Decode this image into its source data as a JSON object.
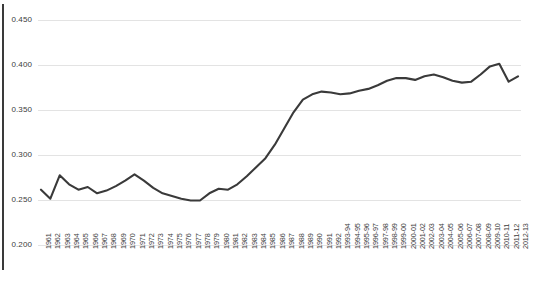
{
  "chart_data": {
    "type": "line",
    "title": "",
    "subtitle": "",
    "xlabel": "",
    "ylabel": "",
    "ylim": [
      0.2,
      0.45
    ],
    "ytick_values": [
      0.2,
      0.25,
      0.3,
      0.35,
      0.4,
      0.45
    ],
    "ytick_labels": [
      "0.200",
      "0.250",
      "0.300",
      "0.350",
      "0.400",
      "0.450"
    ],
    "grid": true,
    "legend": "none",
    "line_color": "#3a3a3a",
    "grid_color": "#e3e3e3",
    "categories": [
      "1961",
      "1962",
      "1963",
      "1964",
      "1965",
      "1966",
      "1967",
      "1968",
      "1969",
      "1970",
      "1971",
      "1972",
      "1973",
      "1974",
      "1975",
      "1976",
      "1977",
      "1978",
      "1979",
      "1980",
      "1981",
      "1982",
      "1983",
      "1984",
      "1985",
      "1986",
      "1987",
      "1988",
      "1989",
      "1990",
      "1991",
      "1992",
      "1993-94",
      "1994-95",
      "1995-96",
      "1996-97",
      "1997-98",
      "1998-99",
      "1999-00",
      "2000-01",
      "2001-02",
      "2002-03",
      "2003-04",
      "2004-05",
      "2005-06",
      "2006-07",
      "2007-08",
      "2008-09",
      "2009-10",
      "2010-11",
      "2011-12",
      "2012-13"
    ],
    "values": [
      0.262,
      0.252,
      0.278,
      0.268,
      0.262,
      0.265,
      0.258,
      0.261,
      0.266,
      0.272,
      0.279,
      0.272,
      0.264,
      0.258,
      0.255,
      0.252,
      0.25,
      0.25,
      0.258,
      0.263,
      0.262,
      0.268,
      0.277,
      0.287,
      0.297,
      0.312,
      0.33,
      0.348,
      0.362,
      0.368,
      0.371,
      0.37,
      0.368,
      0.369,
      0.372,
      0.374,
      0.378,
      0.383,
      0.386,
      0.386,
      0.384,
      0.388,
      0.39,
      0.387,
      0.383,
      0.381,
      0.382,
      0.39,
      0.399,
      0.402,
      0.382,
      0.388
    ],
    "values_tail_note": ""
  },
  "axes": {
    "y_axis_name": "y-axis",
    "x_axis_name": "x-axis"
  }
}
